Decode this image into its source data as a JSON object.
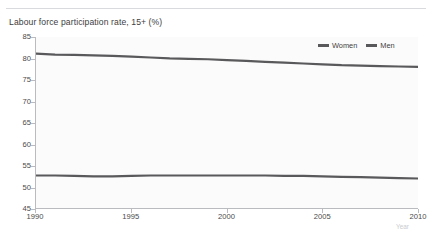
{
  "page": {
    "ghost_top_text": "",
    "background_color": "#ffffff"
  },
  "chart_data": {
    "type": "line",
    "title": "Labour force participation rate, 15+  (%)",
    "xlabel": "Year",
    "ylabel": "",
    "xlim": [
      1990,
      2010
    ],
    "ylim": [
      45,
      85
    ],
    "grid": false,
    "legend_position": "top-right",
    "x": [
      1990,
      1991,
      1992,
      1993,
      1994,
      1995,
      1996,
      1997,
      1998,
      1999,
      2000,
      2001,
      2002,
      2003,
      2004,
      2005,
      2006,
      2007,
      2008,
      2009,
      2010
    ],
    "xticks": [
      1990,
      1995,
      2000,
      2005,
      2010
    ],
    "xtick_labels": [
      "1990",
      "1995",
      "2000",
      "2005",
      "2010"
    ],
    "yticks": [
      45,
      50,
      55,
      60,
      65,
      70,
      75,
      80,
      85
    ],
    "ytick_labels": [
      "45",
      "50",
      "55",
      "60",
      "65",
      "70",
      "75",
      "80",
      "85"
    ],
    "series": [
      {
        "name": "Women",
        "color": "#59595b",
        "values": [
          81.1,
          80.9,
          80.8,
          80.7,
          80.6,
          80.4,
          80.2,
          80.0,
          79.9,
          79.8,
          79.6,
          79.4,
          79.2,
          79.0,
          78.8,
          78.6,
          78.4,
          78.3,
          78.2,
          78.1,
          78.0
        ]
      },
      {
        "name": "Men",
        "color": "#59595b",
        "values": [
          52.6,
          52.6,
          52.5,
          52.4,
          52.4,
          52.5,
          52.6,
          52.6,
          52.6,
          52.6,
          52.6,
          52.6,
          52.6,
          52.5,
          52.5,
          52.4,
          52.3,
          52.2,
          52.1,
          52.0,
          51.9
        ]
      }
    ]
  },
  "legend": {
    "entries": [
      {
        "label": "Women",
        "color": "#59595b"
      },
      {
        "label": "Men",
        "color": "#59595b"
      }
    ]
  }
}
